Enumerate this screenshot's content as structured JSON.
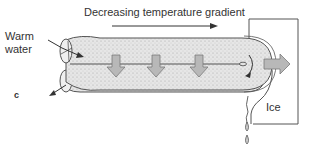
{
  "diagram": {
    "title_gradient": "Decreasing temperature gradient",
    "label_inlet_line1": "Warm",
    "label_inlet_line2": "water",
    "label_panel": "c",
    "label_ice": "Ice"
  },
  "colors": {
    "tube_fill": "#e4e4e4",
    "stipple": "#9a9a9a",
    "arrow_fill": "#b8b8b8",
    "arrow_stroke": "#7a7a7a",
    "outline": "#555555",
    "text": "#333333"
  }
}
